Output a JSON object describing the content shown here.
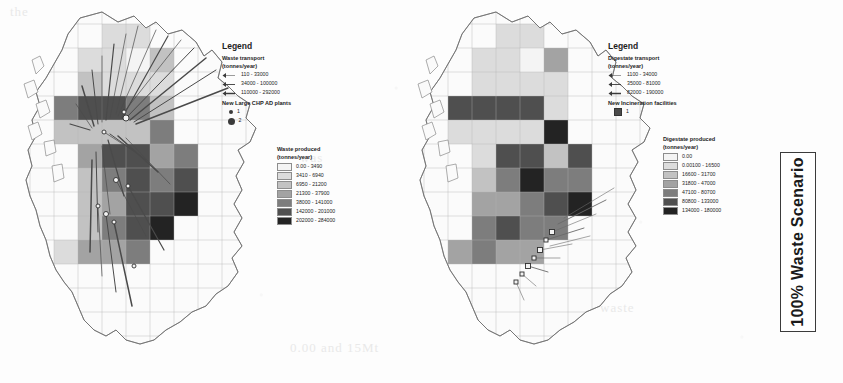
{
  "figure": {
    "scenario_label": "100% Waste Scenario",
    "ghost_text_fragments": [
      "the",
      "was",
      "and",
      "0.00 and 15Mt",
      "waste"
    ]
  },
  "maps": [
    {
      "id": "left",
      "name": "waste-map",
      "region": "Great Britain",
      "legend": {
        "title": "Legend",
        "transport": {
          "heading_line1": "Waste transport",
          "heading_line2": "(tonnes/year)",
          "classes": [
            {
              "label": "110 - 33000",
              "weight": 0.5
            },
            {
              "label": "34000 - 100000",
              "weight": 0.9
            },
            {
              "label": "110000 - 292000",
              "weight": 1.5
            }
          ]
        },
        "points": {
          "heading": "New Large CHP AD plants",
          "classes": [
            {
              "label": "1",
              "size": 4
            },
            {
              "label": "2",
              "size": 7
            }
          ]
        },
        "choropleth": {
          "heading_line1": "Waste produced",
          "heading_line2": "(tonnes/year)",
          "classes": [
            {
              "label": "0.00 - 3490",
              "color": "#f4f4f4"
            },
            {
              "label": "3410 - 6940",
              "color": "#dcdcdc"
            },
            {
              "label": "6950 - 21200",
              "color": "#c2c2c2"
            },
            {
              "label": "21300 - 37900",
              "color": "#a3a3a3"
            },
            {
              "label": "38000 - 141000",
              "color": "#7d7d7d"
            },
            {
              "label": "142000 - 201000",
              "color": "#4f4f4f"
            },
            {
              "label": "202000 - 284000",
              "color": "#232323"
            }
          ]
        }
      }
    },
    {
      "id": "right",
      "name": "digestate-map",
      "region": "Great Britain",
      "legend": {
        "title": "Legend",
        "transport": {
          "heading_line1": "Digestate transport",
          "heading_line2": "(tonnes/year)",
          "classes": [
            {
              "label": "1100 - 34000",
              "weight": 0.5
            },
            {
              "label": "35000 - 81000",
              "weight": 0.9
            },
            {
              "label": "82000 - 190000",
              "weight": 1.5
            }
          ]
        },
        "points": {
          "heading": "New Incineration facilities",
          "classes": [
            {
              "label": "1",
              "size": 6
            }
          ]
        },
        "choropleth": {
          "heading_line1": "Digestate produced",
          "heading_line2": "(tonnes/year)",
          "classes": [
            {
              "label": "0.00",
              "color": "#f4f4f4"
            },
            {
              "label": "0.00100 - 16500",
              "color": "#dcdcdc"
            },
            {
              "label": "16600 - 31700",
              "color": "#c2c2c2"
            },
            {
              "label": "31800 - 47000",
              "color": "#a3a3a3"
            },
            {
              "label": "47100 - 80700",
              "color": "#7d7d7d"
            },
            {
              "label": "80800 - 133000",
              "color": "#4f4f4f"
            },
            {
              "label": "134000 - 180000",
              "color": "#232323"
            }
          ]
        }
      }
    }
  ],
  "chart_data": {
    "type": "heatmap",
    "title": "100% Waste Scenario",
    "grid": {
      "cell_size_px": 24,
      "origin_x": 0,
      "origin_y": 0
    },
    "panels": [
      {
        "name": "Waste produced (tonnes/year)",
        "class_breaks": [
          0,
          3410,
          6950,
          21300,
          38000,
          142000,
          202000,
          284000
        ],
        "cells": [
          {
            "col": 4,
            "row": 1,
            "class": 2
          },
          {
            "col": 5,
            "row": 1,
            "class": 2
          },
          {
            "col": 3,
            "row": 2,
            "class": 2
          },
          {
            "col": 4,
            "row": 2,
            "class": 2
          },
          {
            "col": 5,
            "row": 2,
            "class": 1
          },
          {
            "col": 6,
            "row": 2,
            "class": 3
          },
          {
            "col": 3,
            "row": 3,
            "class": 3
          },
          {
            "col": 4,
            "row": 3,
            "class": 2
          },
          {
            "col": 5,
            "row": 3,
            "class": 2
          },
          {
            "col": 6,
            "row": 3,
            "class": 2
          },
          {
            "col": 2,
            "row": 4,
            "class": 5
          },
          {
            "col": 3,
            "row": 4,
            "class": 6
          },
          {
            "col": 4,
            "row": 4,
            "class": 6
          },
          {
            "col": 5,
            "row": 4,
            "class": 5
          },
          {
            "col": 6,
            "row": 4,
            "class": 3
          },
          {
            "col": 2,
            "row": 5,
            "class": 3
          },
          {
            "col": 3,
            "row": 5,
            "class": 3
          },
          {
            "col": 4,
            "row": 5,
            "class": 3
          },
          {
            "col": 5,
            "row": 5,
            "class": 3
          },
          {
            "col": 6,
            "row": 5,
            "class": 5
          },
          {
            "col": 3,
            "row": 6,
            "class": 4
          },
          {
            "col": 4,
            "row": 6,
            "class": 6
          },
          {
            "col": 5,
            "row": 6,
            "class": 6
          },
          {
            "col": 6,
            "row": 6,
            "class": 4
          },
          {
            "col": 7,
            "row": 6,
            "class": 5
          },
          {
            "col": 3,
            "row": 7,
            "class": 3
          },
          {
            "col": 4,
            "row": 7,
            "class": 5
          },
          {
            "col": 5,
            "row": 7,
            "class": 6
          },
          {
            "col": 6,
            "row": 7,
            "class": 5
          },
          {
            "col": 7,
            "row": 7,
            "class": 6
          },
          {
            "col": 3,
            "row": 8,
            "class": 3
          },
          {
            "col": 4,
            "row": 8,
            "class": 4
          },
          {
            "col": 5,
            "row": 8,
            "class": 6
          },
          {
            "col": 6,
            "row": 8,
            "class": 6
          },
          {
            "col": 7,
            "row": 8,
            "class": 7
          },
          {
            "col": 3,
            "row": 9,
            "class": 3
          },
          {
            "col": 4,
            "row": 9,
            "class": 5
          },
          {
            "col": 5,
            "row": 9,
            "class": 6
          },
          {
            "col": 6,
            "row": 9,
            "class": 7
          },
          {
            "col": 2,
            "row": 10,
            "class": 2
          },
          {
            "col": 3,
            "row": 10,
            "class": 4
          },
          {
            "col": 4,
            "row": 10,
            "class": 4
          },
          {
            "col": 5,
            "row": 10,
            "class": 5
          }
        ],
        "flow_count": 28,
        "plant_count": 9
      },
      {
        "name": "Digestate produced (tonnes/year)",
        "class_breaks": [
          0,
          0.001,
          16600,
          31800,
          47100,
          80800,
          134000,
          180000
        ],
        "cells": [
          {
            "col": 4,
            "row": 1,
            "class": 2
          },
          {
            "col": 5,
            "row": 1,
            "class": 2
          },
          {
            "col": 3,
            "row": 2,
            "class": 2
          },
          {
            "col": 4,
            "row": 2,
            "class": 2
          },
          {
            "col": 5,
            "row": 2,
            "class": 1
          },
          {
            "col": 6,
            "row": 2,
            "class": 4
          },
          {
            "col": 3,
            "row": 3,
            "class": 2
          },
          {
            "col": 4,
            "row": 3,
            "class": 2
          },
          {
            "col": 5,
            "row": 3,
            "class": 2
          },
          {
            "col": 6,
            "row": 3,
            "class": 2
          },
          {
            "col": 2,
            "row": 4,
            "class": 6
          },
          {
            "col": 3,
            "row": 4,
            "class": 6
          },
          {
            "col": 4,
            "row": 4,
            "class": 6
          },
          {
            "col": 5,
            "row": 4,
            "class": 6
          },
          {
            "col": 6,
            "row": 4,
            "class": 2
          },
          {
            "col": 2,
            "row": 5,
            "class": 2
          },
          {
            "col": 3,
            "row": 5,
            "class": 2
          },
          {
            "col": 4,
            "row": 5,
            "class": 2
          },
          {
            "col": 5,
            "row": 5,
            "class": 2
          },
          {
            "col": 6,
            "row": 5,
            "class": 7
          },
          {
            "col": 3,
            "row": 6,
            "class": 2
          },
          {
            "col": 4,
            "row": 6,
            "class": 6
          },
          {
            "col": 5,
            "row": 6,
            "class": 6
          },
          {
            "col": 6,
            "row": 6,
            "class": 3
          },
          {
            "col": 7,
            "row": 6,
            "class": 6
          },
          {
            "col": 3,
            "row": 7,
            "class": 3
          },
          {
            "col": 4,
            "row": 7,
            "class": 5
          },
          {
            "col": 5,
            "row": 7,
            "class": 7
          },
          {
            "col": 6,
            "row": 7,
            "class": 5
          },
          {
            "col": 7,
            "row": 7,
            "class": 5
          },
          {
            "col": 3,
            "row": 8,
            "class": 4
          },
          {
            "col": 4,
            "row": 8,
            "class": 4
          },
          {
            "col": 5,
            "row": 8,
            "class": 5
          },
          {
            "col": 6,
            "row": 8,
            "class": 6
          },
          {
            "col": 7,
            "row": 8,
            "class": 7
          },
          {
            "col": 3,
            "row": 9,
            "class": 5
          },
          {
            "col": 4,
            "row": 9,
            "class": 6
          },
          {
            "col": 5,
            "row": 9,
            "class": 5
          },
          {
            "col": 6,
            "row": 9,
            "class": 5
          },
          {
            "col": 2,
            "row": 10,
            "class": 4
          },
          {
            "col": 3,
            "row": 10,
            "class": 5
          },
          {
            "col": 4,
            "row": 10,
            "class": 4
          },
          {
            "col": 5,
            "row": 10,
            "class": 4
          }
        ],
        "flow_count": 10,
        "facility_count": 7
      }
    ]
  }
}
